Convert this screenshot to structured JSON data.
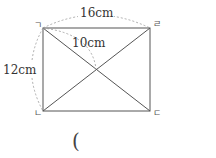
{
  "diagram": {
    "shape": "rectangle",
    "vertices": {
      "top_left": "ㄱ",
      "top_right": "ㄹ",
      "bottom_left": "ㄴ",
      "bottom_right": "ㄷ"
    },
    "measurements": {
      "top_side": "16cm",
      "left_side": "12cm",
      "half_diagonal": "10cm"
    },
    "answer_paren": "(",
    "colors": {
      "line": "#555555",
      "dashed": "#999999",
      "text": "#333333"
    }
  }
}
